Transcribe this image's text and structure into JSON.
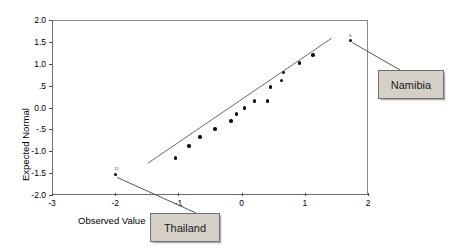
{
  "chart_data": {
    "type": "scatter",
    "title": "",
    "xlabel": "Observed Value",
    "ylabel": "Expected Normal",
    "xlim": [
      -3,
      2
    ],
    "ylim": [
      -2.0,
      2.0
    ],
    "grid": false,
    "legend": null,
    "xticks": [
      "-3",
      "-2",
      "-1",
      "0",
      "1",
      "2"
    ],
    "xtick_values": [
      -3,
      -2,
      -1,
      0,
      1,
      2
    ],
    "yticks": [
      "2.0",
      "1.5",
      "1.0",
      ".5",
      "0.0",
      "-.5",
      "-1.0",
      "-1.5",
      "-2.0"
    ],
    "ytick_values": [
      2.0,
      1.5,
      1.0,
      0.5,
      0.0,
      -0.5,
      -1.0,
      -1.5,
      -2.0
    ],
    "points": [
      {
        "x": -2.0,
        "y": -1.53,
        "label": "12"
      },
      {
        "x": -1.05,
        "y": -1.15,
        "label": ""
      },
      {
        "x": -0.83,
        "y": -0.88,
        "label": ""
      },
      {
        "x": -0.66,
        "y": -0.67,
        "label": ""
      },
      {
        "x": -0.42,
        "y": -0.49,
        "label": ""
      },
      {
        "x": -0.17,
        "y": -0.31,
        "label": ""
      },
      {
        "x": -0.08,
        "y": -0.15,
        "label": ""
      },
      {
        "x": 0.05,
        "y": -0.01,
        "label": ""
      },
      {
        "x": 0.2,
        "y": 0.15,
        "label": ""
      },
      {
        "x": 0.41,
        "y": 0.15,
        "label": ""
      },
      {
        "x": 0.46,
        "y": 0.47,
        "label": ""
      },
      {
        "x": 0.63,
        "y": 0.62,
        "label": ""
      },
      {
        "x": 0.66,
        "y": 0.8,
        "label": ""
      },
      {
        "x": 0.92,
        "y": 1.02,
        "label": ""
      },
      {
        "x": 1.13,
        "y": 1.2,
        "label": ""
      },
      {
        "x": 1.72,
        "y": 1.53,
        "label": "6"
      }
    ],
    "fit_line": {
      "x0": -1.48,
      "y0": -1.27,
      "x1": 1.42,
      "y1": 1.58
    }
  },
  "annotations": [
    {
      "name": "namibia",
      "text": "Namibia"
    },
    {
      "name": "thailand",
      "text": "Thailand"
    }
  ],
  "colors": {
    "marker": "#0d0d0d",
    "fit_line": "#6a6a6a",
    "frame": "#7a7a7a",
    "callout_fill": "#d4d0c8",
    "callout_border": "#707070",
    "text": "#000000"
  }
}
